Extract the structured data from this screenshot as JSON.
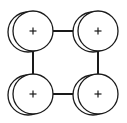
{
  "diagram": {
    "type": "node-graph",
    "layout": "2x2 square",
    "colors": {
      "stroke": "#1a1a1a",
      "background": "#ffffff",
      "node_fill": "#ffffff"
    },
    "node_radius": 20,
    "back_offset": {
      "dx": -5,
      "dy": 1
    },
    "plus_half_size": 3.5,
    "nodes": [
      {
        "id": "top-left",
        "cx": 33,
        "cy": 31,
        "symbol": "+"
      },
      {
        "id": "top-right",
        "cx": 98,
        "cy": 31,
        "symbol": "+"
      },
      {
        "id": "bottom-left",
        "cx": 33,
        "cy": 94,
        "symbol": "+"
      },
      {
        "id": "bottom-right",
        "cx": 98,
        "cy": 94,
        "symbol": "+"
      }
    ],
    "edges": [
      {
        "from": "top-left",
        "to": "top-right"
      },
      {
        "from": "bottom-left",
        "to": "bottom-right"
      },
      {
        "from": "top-left",
        "to": "bottom-left"
      },
      {
        "from": "top-right",
        "to": "bottom-right"
      }
    ]
  }
}
